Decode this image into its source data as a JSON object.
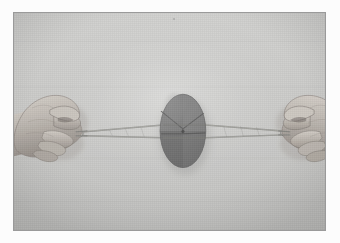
{
  "page": {
    "background_color": "#fcfcfc",
    "caption": ""
  },
  "photo": {
    "name": "button-whirligig-photo",
    "description": "Black-and-white photograph of two hands pulling the ends of a twisted string loop threaded through a large disc (button whirligig / buzzer toy) held at the centre.",
    "backdrop_color": "#c9c9c7",
    "border_color": "#9a9a9a",
    "width_px": 313,
    "height_px": 219
  },
  "subject": {
    "disc": {
      "label": "spinning disc",
      "shape": "ellipse",
      "center_x": 170,
      "center_y": 119,
      "radius_x": 23,
      "radius_y": 37,
      "fill_color": "#6f6f6f",
      "highlight_color": "#7c7c7c",
      "shadow_color": "#5d5d5d",
      "line_color": "#4a4a4a",
      "hub_color": "#3f3f3f"
    },
    "string": {
      "label": "twisted string loop",
      "color": "#8c8c88",
      "highlight_color": "#b4b4b0",
      "left_anchor_x": 66,
      "left_anchor_y": 122,
      "right_anchor_x": 272,
      "right_anchor_y": 121,
      "strand_count": 2
    },
    "left_hand": {
      "label": "left hand gripping string loop",
      "skin_color": "#b9b3ac",
      "skin_shadow": "#8e8781",
      "skin_highlight": "#d2ccc5",
      "outline_color": "#6d6761"
    },
    "right_hand": {
      "label": "right hand gripping string loop",
      "skin_color": "#bdb7b0",
      "skin_shadow": "#928b85",
      "skin_highlight": "#d6d0c9",
      "outline_color": "#6d6761"
    },
    "speck": {
      "label": "small dark speck on backdrop",
      "x": 161,
      "y": 6
    }
  },
  "colors": {
    "photo_backdrop": "#c9c9c7",
    "photo_border": "#9a9a9a",
    "page": "#fcfcfc",
    "disc": "#6f6f6f",
    "string": "#8c8c88",
    "skin": "#b9b3ac"
  }
}
